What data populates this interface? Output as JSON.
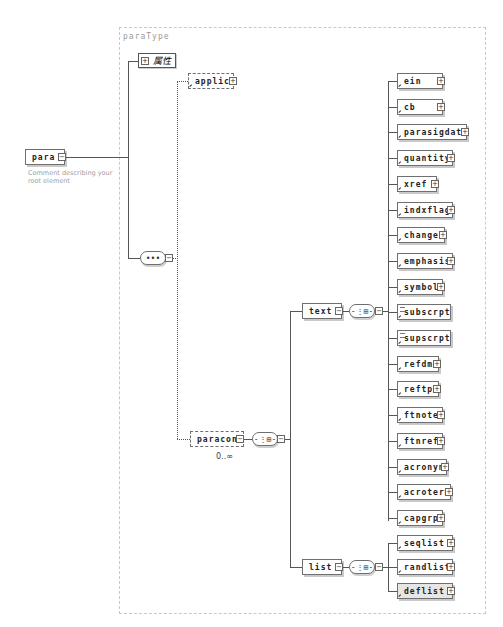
{
  "diagram": {
    "type_name": "paraType",
    "root": {
      "name": "para",
      "comment": [
        "Comment describing your",
        "root element"
      ]
    },
    "attributes_label": "属性",
    "sequence_symbol": "•••",
    "choice_symbol": "-⋮⊞-",
    "applic": "applic",
    "paracon": {
      "name": "paracon",
      "occurrence": "0..∞"
    },
    "text": "text",
    "list": "list",
    "text_children": [
      {
        "name": "ein",
        "ref": true,
        "expand": true,
        "simple": false
      },
      {
        "name": "cb",
        "ref": true,
        "expand": true,
        "simple": false
      },
      {
        "name": "parasigdate",
        "ref": true,
        "expand": true,
        "simple": false
      },
      {
        "name": "quantity",
        "ref": true,
        "expand": true,
        "simple": false
      },
      {
        "name": "xref",
        "ref": true,
        "expand": true,
        "simple": false
      },
      {
        "name": "indxflag",
        "ref": true,
        "expand": true,
        "simple": false
      },
      {
        "name": "change",
        "ref": true,
        "expand": true,
        "simple": false
      },
      {
        "name": "emphasis",
        "ref": true,
        "expand": true,
        "simple": false
      },
      {
        "name": "symbol",
        "ref": true,
        "expand": true,
        "simple": false
      },
      {
        "name": "subscrpt",
        "ref": true,
        "expand": false,
        "simple": true
      },
      {
        "name": "supscrpt",
        "ref": true,
        "expand": false,
        "simple": true
      },
      {
        "name": "refdm",
        "ref": true,
        "expand": true,
        "simple": false
      },
      {
        "name": "reftp",
        "ref": true,
        "expand": true,
        "simple": false
      },
      {
        "name": "ftnote",
        "ref": true,
        "expand": true,
        "simple": false
      },
      {
        "name": "ftnref",
        "ref": true,
        "expand": true,
        "simple": false
      },
      {
        "name": "acronym",
        "ref": true,
        "expand": true,
        "simple": false
      },
      {
        "name": "acroterm",
        "ref": true,
        "expand": true,
        "simple": false
      },
      {
        "name": "capgrp",
        "ref": true,
        "expand": true,
        "simple": false
      }
    ],
    "list_children": [
      {
        "name": "seqlist",
        "shaded": false
      },
      {
        "name": "randlist",
        "shaded": false
      },
      {
        "name": "deflist",
        "shaded": true
      }
    ],
    "expand_glyph": "+",
    "collapse_glyph": "−"
  }
}
